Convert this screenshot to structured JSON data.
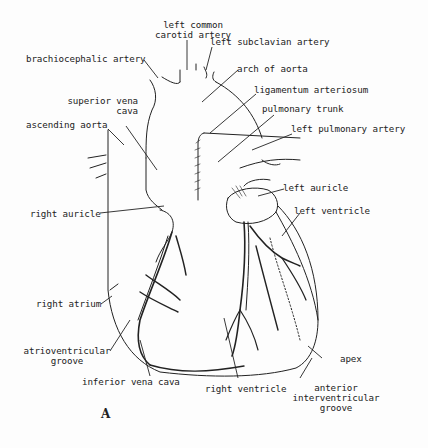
{
  "figure": {
    "panel_label": "A"
  },
  "labels": {
    "left_common_carotid_artery": {
      "line1": "left common",
      "line2": "carotid artery"
    },
    "left_subclavian_artery": "left subclavian artery",
    "brachiocephalic_artery": "brachiocephalic artery",
    "arch_of_aorta": "arch of aorta",
    "ligamentum_arteriosum": "ligamentum arteriosum",
    "superior_vena_cava": {
      "line1": "superior vena",
      "line2": "cava"
    },
    "pulmonary_trunk": "pulmonary trunk",
    "ascending_aorta": "ascending aorta",
    "left_pulmonary_artery": "left pulmonary artery",
    "left_auricle": "left auricle",
    "right_auricle": "right auricle",
    "left_ventricle": "left ventricle",
    "right_atrium": "right atrium",
    "atrioventricular_groove": {
      "line1": "atrioventricular",
      "line2": "groove"
    },
    "inferior_vena_cava": "inferior vena cava",
    "apex": "apex",
    "right_ventricle": "right ventricle",
    "anterior_interventricular_groove": {
      "line1": "anterior",
      "line2": "interventricular",
      "line3": "groove"
    }
  },
  "colors": {
    "ink": "#222222",
    "background": "#fdfdfd"
  }
}
